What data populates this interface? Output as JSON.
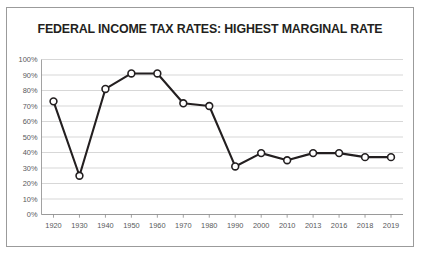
{
  "chart_data": {
    "type": "line",
    "title": "FEDERAL INCOME TAX RATES: HIGHEST MARGINAL RATE",
    "xlabel": "",
    "ylabel": "",
    "ylim": [
      0,
      100
    ],
    "ytick_labels": [
      "100%",
      "90%",
      "80%",
      "70%",
      "60%",
      "50%",
      "40%",
      "30%",
      "20%",
      "10%",
      "0%"
    ],
    "ytick_values": [
      100,
      90,
      80,
      70,
      60,
      50,
      40,
      30,
      20,
      10,
      0
    ],
    "grid": true,
    "legend": "none",
    "categories": [
      "1920",
      "1930",
      "1940",
      "1950",
      "1960",
      "1970",
      "1980",
      "1990",
      "2000",
      "2010",
      "2013",
      "2016",
      "2018",
      "2019"
    ],
    "values": [
      73,
      25,
      81,
      91,
      91,
      71.75,
      70,
      31,
      39.6,
      35,
      39.6,
      39.6,
      37,
      37
    ],
    "series": [
      {
        "name": "Highest Marginal Rate",
        "values": [
          73,
          25,
          81,
          91,
          91,
          71.75,
          70,
          31,
          39.6,
          35,
          39.6,
          39.6,
          37,
          37
        ]
      }
    ],
    "colors": {
      "line": "#231f20",
      "marker_fill": "#ffffff",
      "marker_stroke": "#231f20",
      "gridline": "#c6c6c6",
      "axis": "#8a8a8a",
      "border": "#9b9b9b",
      "background": "#ffffff",
      "title_text": "#231f20",
      "tick_text": "#58595b"
    }
  }
}
